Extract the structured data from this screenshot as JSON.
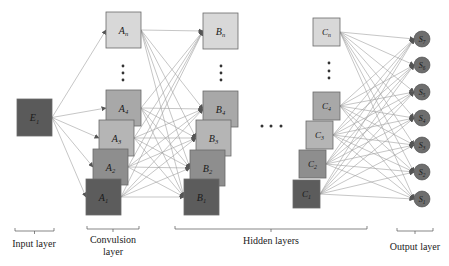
{
  "diagram": {
    "type": "convolutional-neural-network-architecture",
    "colors": {
      "input": "#5a5a5a",
      "level_n": "#d8d8d8",
      "level_4": "#a8a8a8",
      "level_3": "#b5b5b5",
      "level_2": "#8e8e8e",
      "level_1": "#5c5c5c",
      "output": "#6e6e6e",
      "edge": "#9a9a9a",
      "border": "#6a6a6a"
    },
    "input_layer": {
      "caption": "Input layer",
      "nodes": [
        {
          "id": "E1",
          "base": "E",
          "sub": "1"
        }
      ]
    },
    "convolution_layer": {
      "caption_line1": "Convulsion",
      "caption_line2": "layer",
      "nodes": [
        {
          "id": "An",
          "base": "A",
          "sub": "n"
        },
        {
          "id": "A4",
          "base": "A",
          "sub": "4"
        },
        {
          "id": "A3",
          "base": "A",
          "sub": "3"
        },
        {
          "id": "A2",
          "base": "A",
          "sub": "2"
        },
        {
          "id": "A1",
          "base": "A",
          "sub": "1"
        }
      ]
    },
    "hidden_layers": {
      "caption": "Hidden layers",
      "ellipsis": "• • •",
      "layer_b": [
        {
          "id": "Bn",
          "base": "B",
          "sub": "n"
        },
        {
          "id": "B4",
          "base": "B",
          "sub": "4"
        },
        {
          "id": "B3",
          "base": "B",
          "sub": "3"
        },
        {
          "id": "B2",
          "base": "B",
          "sub": "2"
        },
        {
          "id": "B1",
          "base": "B",
          "sub": "1"
        }
      ],
      "layer_c": [
        {
          "id": "Cn",
          "base": "C",
          "sub": "n"
        },
        {
          "id": "C4",
          "base": "C",
          "sub": "4"
        },
        {
          "id": "C3",
          "base": "C",
          "sub": "3"
        },
        {
          "id": "C2",
          "base": "C",
          "sub": "2"
        },
        {
          "id": "C1",
          "base": "C",
          "sub": "1"
        }
      ]
    },
    "output_layer": {
      "caption": "Output layer",
      "nodes": [
        {
          "id": "S7",
          "base": "S",
          "sub": "7"
        },
        {
          "id": "S6",
          "base": "S",
          "sub": "6"
        },
        {
          "id": "S5",
          "base": "S",
          "sub": "5"
        },
        {
          "id": "S4",
          "base": "S",
          "sub": "4"
        },
        {
          "id": "S3",
          "base": "S",
          "sub": "3"
        },
        {
          "id": "S2",
          "base": "S",
          "sub": "2"
        },
        {
          "id": "S1",
          "base": "S",
          "sub": "1"
        }
      ]
    },
    "vertical_ellipsis": "⋮"
  }
}
